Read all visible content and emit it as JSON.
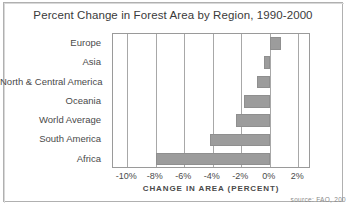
{
  "chart_data": {
    "type": "bar",
    "orientation": "horizontal",
    "title": "Percent Change in Forest Area by Region, 1990-2000",
    "xlabel": "CHANGE IN AREA (PERCENT)",
    "ylabel": "",
    "categories": [
      "Europe",
      "Asia",
      "North & Central America",
      "Oceania",
      "World Average",
      "South America",
      "Africa"
    ],
    "values": [
      0.8,
      -0.4,
      -0.9,
      -1.8,
      -2.4,
      -4.2,
      -8.0
    ],
    "xlim": [
      -11,
      2.9
    ],
    "xticks": [
      -10,
      -8,
      -6,
      -4,
      -2,
      0,
      2
    ],
    "xtick_labels": [
      "-10%",
      "-8%",
      "-6%",
      "-4%",
      "-2%",
      "0%",
      "2%"
    ],
    "grid": "vertical",
    "legend": "none",
    "bar_color": "#9c9c9c",
    "bar_border_color": "#8f8f8f",
    "axis_color": "#9a9a9a",
    "text_color": "#4a4a4a",
    "source_note": "source: FAO, 200"
  }
}
